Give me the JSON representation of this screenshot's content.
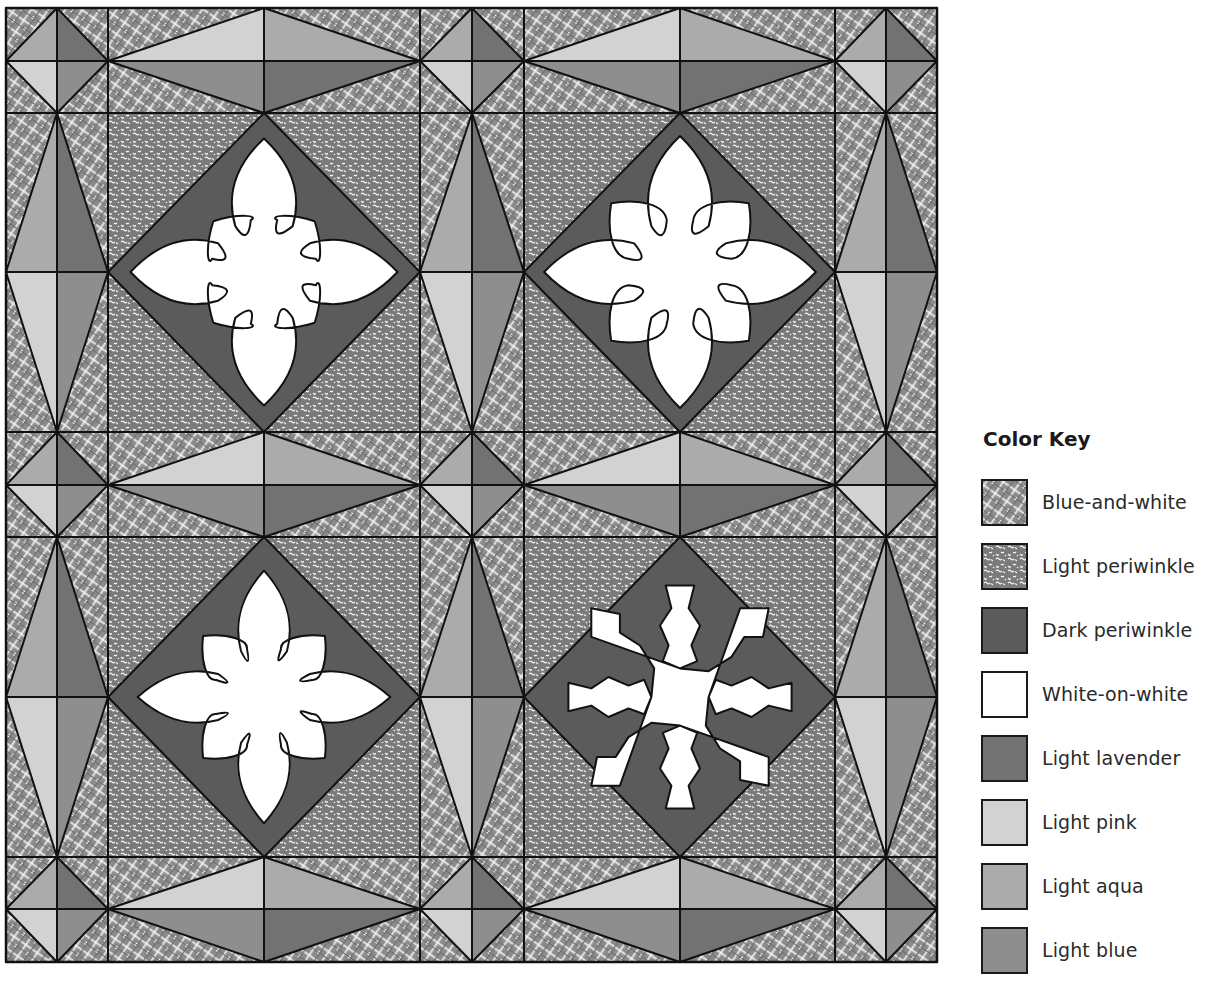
{
  "legend": {
    "title": "Color Key",
    "items": [
      {
        "key": "blue-and-white",
        "label": "Blue-and-white",
        "pattern": "plaid"
      },
      {
        "key": "light-periwinkle",
        "label": "Light periwinkle",
        "pattern": "squiggle"
      },
      {
        "key": "dark-periwinkle",
        "label": "Dark periwinkle",
        "pattern": "solid"
      },
      {
        "key": "white-on-white",
        "label": "White-on-white",
        "pattern": "solid"
      },
      {
        "key": "light-lavender",
        "label": "Light lavender",
        "pattern": "solid"
      },
      {
        "key": "light-pink",
        "label": "Light pink",
        "pattern": "solid"
      },
      {
        "key": "light-aqua",
        "label": "Light aqua",
        "pattern": "solid"
      },
      {
        "key": "light-blue",
        "label": "Light blue",
        "pattern": "solid"
      }
    ]
  },
  "colors": {
    "blue-and-white": "#8b8b8b",
    "light-periwinkle": "#7a7a7a",
    "dark-periwinkle": "#5b5b5b",
    "white-on-white": "#ffffff",
    "light-lavender": "#727272",
    "light-pink": "#d2d2d2",
    "light-aqua": "#ababab",
    "light-blue": "#8e8e8e",
    "outline": "#111111"
  },
  "quilt": {
    "grid_x": [
      6,
      57,
      108,
      264,
      420,
      472,
      524,
      680,
      835,
      886,
      937
    ],
    "grid_y": [
      8,
      61,
      113,
      272,
      432,
      485,
      537,
      697,
      857,
      909,
      962
    ],
    "blocks": [
      {
        "name": "snowflake-block-1",
        "row": 0,
        "col": 0,
        "motif": "scalloped"
      },
      {
        "name": "snowflake-block-2",
        "row": 0,
        "col": 1,
        "motif": "bulb"
      },
      {
        "name": "snowflake-block-3",
        "row": 1,
        "col": 0,
        "motif": "fern"
      },
      {
        "name": "snowflake-block-4",
        "row": 1,
        "col": 1,
        "motif": "angular"
      }
    ]
  }
}
